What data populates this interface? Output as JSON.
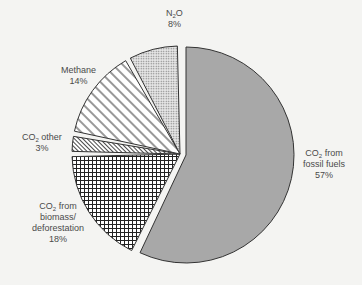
{
  "chart_data": {
    "type": "pie",
    "title": "",
    "exploded": [
      "CO2 from biomass/deforestation",
      "CO2 other",
      "Methane",
      "N2O"
    ],
    "start_angle_deg": 0,
    "direction": "clockwise",
    "slices": [
      {
        "label": "CO2 from fossil fuels",
        "value": 57,
        "fill": "#a8a8a8",
        "pattern": "solid"
      },
      {
        "label": "CO2 from biomass/deforestation",
        "value": 18,
        "fill": "#ffffff",
        "pattern": "grid"
      },
      {
        "label": "CO2 other",
        "value": 3,
        "fill": "#ffffff",
        "pattern": "fine-diagonal"
      },
      {
        "label": "Methane",
        "value": 14,
        "fill": "#ffffff",
        "pattern": "diagonal-stripes"
      },
      {
        "label": "N2O",
        "value": 8,
        "fill": "#ffffff",
        "pattern": "dots"
      }
    ]
  },
  "labels": {
    "fossil": {
      "line1_pre": "CO",
      "line1_sub": "2",
      "line1_post": " from",
      "line2": "fossil fuels",
      "pct": "57%"
    },
    "biomass": {
      "line1_pre": "CO",
      "line1_sub": "2",
      "line1_post": " from",
      "line2": "biomass/",
      "line3": "deforestation",
      "pct": "18%"
    },
    "other": {
      "line1_pre": "CO",
      "line1_sub": "2",
      "line1_post": " other",
      "pct": "3%"
    },
    "methane": {
      "line1": "Methane",
      "pct": "14%"
    },
    "n2o": {
      "line1_pre": "N",
      "line1_sub": "2",
      "line1_post": "O",
      "pct": "8%"
    }
  }
}
